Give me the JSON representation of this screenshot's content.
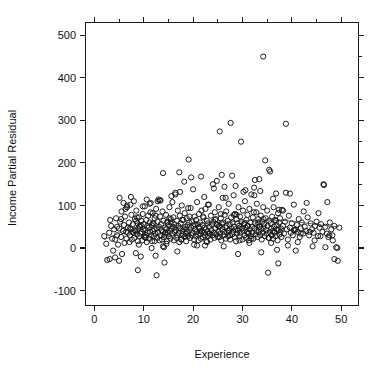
{
  "figure": {
    "width": 377,
    "height": 368,
    "background": "#ffffff",
    "foreground": "#1a1a1a"
  },
  "axis_titles": {
    "x": "Experience",
    "y": "Income Partial Residual"
  },
  "chart_data": {
    "type": "scatter",
    "title": "",
    "subtitle": "",
    "xlabel": "Experience",
    "ylabel": "Income Partial Residual",
    "xlim": [
      -1.8,
      53.5
    ],
    "ylim": [
      -135,
      530
    ],
    "xticks": [
      0,
      10,
      20,
      30,
      40,
      50
    ],
    "xtick_labels": [
      "0",
      "10",
      "20",
      "30",
      "40",
      "50"
    ],
    "yticks": [
      -100,
      0,
      100,
      200,
      300,
      400,
      500
    ],
    "ytick_labels": [
      "-100",
      "0",
      "100",
      "200",
      "300",
      "400",
      "500"
    ],
    "grid": false,
    "legend": null,
    "legend_position": "none",
    "marker": "open-circle",
    "marker_size": 2.6,
    "marker_color": "#141414",
    "n_points": 520,
    "annotations": [],
    "series": [
      {
        "name": "Income partial residual vs experience",
        "marker": "open-circle",
        "x": [
          2.0,
          2.4,
          2.6,
          3.0,
          3.1,
          3.4,
          3.6,
          3.8,
          4.0,
          4.2,
          4.4,
          4.6,
          4.8,
          5.0,
          5.1,
          5.2,
          5.4,
          5.5,
          5.6,
          5.8,
          6.0,
          6.1,
          6.2,
          6.4,
          6.5,
          6.6,
          6.8,
          7.0,
          7.1,
          7.2,
          7.3,
          7.4,
          7.5,
          7.6,
          7.8,
          7.9,
          8.0,
          8.1,
          8.2,
          8.3,
          8.4,
          8.5,
          8.6,
          8.7,
          8.8,
          8.9,
          9.0,
          9.1,
          9.2,
          9.3,
          9.4,
          9.5,
          9.6,
          9.7,
          9.8,
          9.9,
          10.0,
          10.1,
          10.2,
          10.3,
          10.4,
          10.5,
          10.6,
          10.7,
          10.8,
          10.9,
          11.0,
          11.1,
          11.2,
          11.3,
          11.4,
          11.5,
          11.6,
          11.7,
          11.8,
          11.9,
          12.0,
          12.1,
          12.2,
          12.3,
          12.4,
          12.5,
          12.6,
          12.7,
          12.8,
          12.9,
          13.0,
          13.1,
          13.2,
          13.3,
          13.4,
          13.5,
          13.6,
          13.7,
          13.8,
          13.9,
          14.0,
          14.1,
          14.2,
          14.3,
          14.4,
          14.5,
          14.6,
          14.7,
          14.8,
          14.9,
          15.0,
          15.1,
          15.2,
          15.3,
          15.4,
          15.5,
          15.6,
          15.7,
          15.8,
          15.9,
          16.0,
          16.1,
          16.2,
          16.3,
          16.4,
          16.5,
          16.6,
          16.7,
          16.8,
          16.9,
          17.0,
          17.1,
          17.2,
          17.3,
          17.4,
          17.5,
          17.6,
          17.7,
          17.8,
          17.9,
          18.0,
          18.1,
          18.2,
          18.3,
          18.4,
          18.5,
          18.6,
          18.7,
          18.8,
          18.9,
          19.0,
          19.1,
          19.2,
          19.3,
          19.4,
          19.5,
          19.6,
          19.7,
          19.8,
          19.9,
          20.0,
          20.1,
          20.2,
          20.3,
          20.4,
          20.5,
          20.6,
          20.7,
          20.8,
          20.9,
          21.0,
          21.1,
          21.2,
          21.3,
          21.4,
          21.5,
          21.6,
          21.7,
          21.8,
          21.9,
          22.0,
          22.1,
          22.2,
          22.3,
          22.4,
          22.5,
          22.6,
          22.7,
          22.8,
          22.9,
          23.0,
          23.1,
          23.2,
          23.3,
          23.4,
          23.5,
          23.6,
          23.7,
          23.8,
          23.9,
          24.0,
          24.1,
          24.2,
          24.3,
          24.4,
          24.5,
          24.6,
          24.7,
          24.8,
          24.9,
          25.0,
          25.1,
          25.2,
          25.3,
          25.4,
          25.5,
          25.6,
          25.7,
          25.8,
          25.9,
          26.0,
          26.1,
          26.2,
          26.3,
          26.4,
          26.5,
          26.6,
          26.7,
          26.8,
          26.9,
          27.0,
          27.1,
          27.2,
          27.3,
          27.4,
          27.5,
          27.6,
          27.7,
          27.8,
          27.9,
          28.0,
          28.1,
          28.2,
          28.3,
          28.4,
          28.5,
          28.6,
          28.7,
          28.8,
          28.9,
          29.0,
          29.1,
          29.2,
          29.3,
          29.4,
          29.5,
          29.6,
          29.7,
          29.8,
          29.9,
          30.0,
          30.1,
          30.2,
          30.3,
          30.4,
          30.5,
          30.6,
          30.7,
          30.8,
          30.9,
          31.0,
          31.1,
          31.2,
          31.3,
          31.4,
          31.5,
          31.6,
          31.7,
          31.8,
          31.9,
          32.0,
          32.1,
          32.2,
          32.3,
          32.4,
          32.5,
          32.6,
          32.7,
          32.8,
          32.9,
          33.0,
          33.1,
          33.2,
          33.3,
          33.4,
          33.5,
          33.6,
          33.7,
          33.8,
          33.9,
          34.0,
          34.1,
          34.2,
          34.3,
          34.4,
          34.5,
          34.6,
          34.7,
          34.8,
          34.9,
          35.0,
          35.1,
          35.2,
          35.3,
          35.4,
          35.5,
          35.6,
          35.7,
          35.8,
          35.9,
          36.0,
          36.1,
          36.2,
          36.3,
          36.4,
          36.5,
          36.6,
          36.7,
          36.8,
          36.9,
          37.0,
          37.1,
          37.2,
          37.3,
          37.4,
          37.5,
          37.6,
          37.7,
          37.8,
          37.9,
          38.0,
          38.2,
          38.4,
          38.6,
          38.8,
          39.0,
          39.2,
          39.4,
          39.6,
          39.8,
          40.0,
          40.2,
          40.4,
          40.6,
          40.8,
          41.0,
          41.2,
          41.4,
          41.6,
          41.8,
          42.0,
          42.3,
          42.6,
          42.9,
          43.2,
          43.5,
          43.8,
          44.1,
          44.4,
          44.7,
          45.0,
          45.3,
          45.6,
          45.9,
          46.2,
          46.5,
          46.8,
          47.1,
          47.4,
          47.7,
          48.0,
          48.3,
          48.6,
          49.0,
          49.3,
          49.6,
          5.9,
          6.3,
          7.7,
          8.45,
          9.15,
          10.25,
          11.35,
          12.15,
          13.25,
          14.35,
          15.45,
          16.25,
          17.35,
          18.45,
          19.25,
          20.35,
          21.45,
          22.25,
          23.35,
          24.45,
          25.25,
          26.35,
          27.45,
          28.25,
          29.35,
          30.45,
          31.25,
          32.35,
          33.45,
          34.25,
          35.35,
          36.45,
          37.25,
          12.6,
          13.9,
          17.2,
          19.6,
          25.8,
          27.9,
          30.6,
          33.6,
          35.4,
          39.6,
          46.4,
          4.2,
          5.0,
          8.8,
          13.9,
          20.8,
          29.1,
          33.8,
          48.6,
          9.0,
          11.6,
          14.1,
          16.8,
          22.4,
          26.2,
          31.4,
          37.0,
          41.2,
          44.6,
          7.4,
          10.6,
          12.8,
          15.6,
          18.2,
          21.6,
          24.2,
          28.6,
          32.4,
          36.2,
          38.8,
          43.0,
          47.2,
          3.2,
          6.6,
          9.8,
          11.2,
          13.4,
          16.4,
          19.0,
          23.0,
          26.6,
          30.2,
          34.2,
          38.2,
          42.4,
          45.4,
          48.2,
          6.8,
          8.2,
          10.4,
          12.2,
          14.6,
          17.6,
          20.2,
          22.8,
          25.4,
          29.4,
          31.8,
          35.8,
          39.2,
          41.8,
          44.2,
          46.8,
          49.2,
          4.6,
          7.2,
          9.4,
          11.8,
          14.8,
          18.6,
          21.2,
          24.8,
          27.2,
          31.0,
          33.2,
          36.8,
          40.4,
          43.6,
          47.6,
          5.4,
          8.6,
          12.4,
          15.2,
          17.8,
          22.0,
          25.6,
          28.8,
          32.8,
          37.4,
          40.8,
          45.8
        ],
        "y": [
          28,
          10,
          -28,
          36,
          -26,
          52,
          22,
          -6,
          44,
          20,
          70,
          30,
          8,
          46,
          118,
          62,
          26,
          86,
          -14,
          40,
          54,
          12,
          74,
          38,
          22,
          96,
          48,
          60,
          14,
          30,
          102,
          44,
          78,
          20,
          56,
          36,
          110,
          24,
          68,
          40,
          -12,
          88,
          32,
          58,
          16,
          46,
          72,
          28,
          50,
          34,
          -20,
          64,
          38,
          18,
          80,
          44,
          56,
          26,
          98,
          42,
          30,
          66,
          14,
          52,
          36,
          76,
          48,
          22,
          60,
          38,
          106,
          30,
          54,
          16,
          82,
          40,
          58,
          28,
          70,
          34,
          -18,
          92,
          46,
          24,
          62,
          36,
          114,
          50,
          18,
          74,
          30,
          56,
          42,
          20,
          86,
          38,
          64,
          26,
          -34,
          48,
          32,
          78,
          44,
          16,
          60,
          36,
          54,
          28,
          96,
          40,
          22,
          68,
          46,
          34,
          108,
          50,
          72,
          18,
          56,
          38,
          130,
          42,
          24,
          64,
          30,
          88,
          52,
          36,
          14,
          76,
          46,
          58,
          20,
          100,
          40,
          32,
          66,
          44,
          26,
          82,
          50,
          34,
          16,
          70,
          38,
          54,
          28,
          208,
          60,
          42,
          24,
          94,
          48,
          30,
          62,
          36,
          138,
          52,
          20,
          74,
          44,
          28,
          66,
          38,
          108,
          56,
          32,
          18,
          80,
          46,
          60,
          34,
          22,
          88,
          40,
          54,
          26,
          72,
          36,
          48,
          30,
          92,
          44,
          16,
          64,
          38,
          58,
          28,
          102,
          50,
          34,
          20,
          76,
          42,
          56,
          30,
          150,
          62,
          36,
          24,
          84,
          46,
          68,
          32,
          158,
          54,
          26,
          40,
          96,
          50,
          274,
          34,
          70,
          18,
          58,
          44,
          118,
          60,
          30,
          38,
          78,
          48,
          22,
          86,
          52,
          36,
          64,
          28,
          104,
          42,
          56,
          20,
          294,
          72,
          46,
          32,
          60,
          38,
          124,
          50,
          26,
          80,
          44,
          16,
          68,
          34,
          58,
          42,
          96,
          52,
          28,
          74,
          36,
          250,
          62,
          46,
          20,
          88,
          40,
          56,
          30,
          110,
          48,
          24,
          66,
          38,
          78,
          52,
          34,
          18,
          92,
          44,
          60,
          28,
          126,
          50,
          36,
          72,
          22,
          84,
          46,
          160,
          58,
          32,
          40,
          104,
          54,
          26,
          68,
          38,
          162,
          50,
          30,
          76,
          44,
          20,
          62,
          36,
          450,
          48,
          56,
          28,
          206,
          70,
          42,
          34,
          88,
          52,
          -58,
          24,
          64,
          38,
          180,
          58,
          46,
          30,
          74,
          40,
          22,
          96,
          50,
          36,
          66,
          28,
          128,
          54,
          44,
          18,
          82,
          42,
          60,
          32,
          70,
          38,
          46,
          26,
          90,
          52,
          34,
          62,
          292,
          44,
          20,
          76,
          48,
          36,
          58,
          30,
          102,
          42,
          -6,
          54,
          38,
          68,
          26,
          46,
          60,
          34,
          50,
          40,
          72,
          30,
          58,
          44,
          36,
          52,
          62,
          28,
          48,
          56,
          38,
          148,
          50,
          34,
          26,
          60,
          44,
          18,
          52,
          2,
          -30,
          48,
          106,
          92,
          38,
          64,
          52,
          26,
          84,
          44,
          112,
          36,
          60,
          48,
          132,
          28,
          74,
          56,
          40,
          120,
          34,
          66,
          52,
          144,
          30,
          78,
          46,
          58,
          36,
          142,
          50,
          68,
          24,
          38,
          -36,
          -64,
          176,
          178,
          166,
          172,
          170,
          136,
          134,
          184,
          128,
          150,
          -22,
          -30,
          -52,
          4,
          6,
          -14,
          -10,
          -26,
          8,
          0,
          2,
          -8,
          6,
          4,
          12,
          -4,
          14,
          18,
          120,
          114,
          110,
          122,
          156,
          168,
          140,
          146,
          124,
          116,
          130,
          106,
          108,
          66,
          100,
          98,
          104,
          112,
          126,
          94,
          102,
          118,
          132,
          96,
          88,
          86,
          82,
          30,
          36,
          42,
          24,
          16,
          10,
          20,
          8,
          14,
          26,
          18,
          22,
          12,
          6,
          34,
          4,
          2,
          0,
          50,
          46,
          54,
          58,
          62,
          44,
          48,
          56,
          40,
          52,
          60,
          64,
          42,
          38,
          30,
          68,
          72,
          76,
          70,
          66,
          74,
          80,
          78,
          84,
          90,
          44,
          28
        ]
      }
    ],
    "smoother": {
      "name": "lowess-smoother",
      "x": [
        2.0,
        4.0,
        6.0,
        8.0,
        10.0,
        12.0,
        14.0,
        16.0,
        18.0,
        20.0,
        22.0,
        24.0,
        26.0,
        28.0,
        30.0,
        32.0,
        34.0,
        36.0,
        38.0,
        40.0,
        42.0,
        44.0,
        46.0,
        48.0,
        49.5
      ],
      "y": [
        20,
        30,
        40,
        44,
        46,
        48,
        49,
        51,
        54,
        57,
        59,
        60,
        61,
        62,
        64,
        65,
        66,
        66,
        65,
        63,
        60,
        57,
        54,
        51,
        50
      ]
    }
  }
}
